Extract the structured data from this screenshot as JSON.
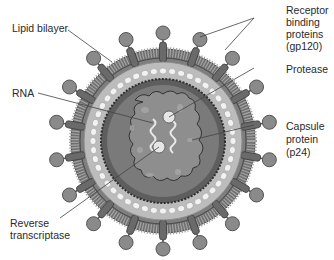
{
  "diagram": {
    "labels": {
      "lipid_bilayer": "Lipid bilayer",
      "rna": "RNA",
      "reverse_transcriptase_1": "Reverse",
      "reverse_transcriptase_2": "transcriptase",
      "receptor_1": "Receptor",
      "receptor_2": "binding",
      "receptor_3": "proteins",
      "receptor_4": "(gp120)",
      "protease": "Protease",
      "capsule_1": "Capsule",
      "capsule_2": "protein",
      "capsule_3": "(p24)"
    },
    "colors": {
      "knob": "#8a8a8a",
      "knob_stroke": "#555555",
      "membrane_outer": "#7a7a7a",
      "membrane_stripe": "#a8a8a8",
      "matrix": "#bdbdbd",
      "beads": "#f2f2f2",
      "capsid": "#6e6e6e",
      "core": "#8e8e8e",
      "leader": "#444444"
    },
    "knob_count": 18
  }
}
